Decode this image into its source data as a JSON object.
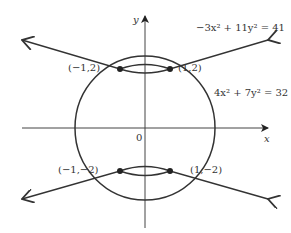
{
  "diagram": {
    "type": "conic-intersection",
    "axes": {
      "x_label": "x",
      "y_label": "y",
      "origin_label": "0"
    },
    "curves": [
      {
        "name": "hyperbola",
        "equation": "−3x² + 11y² = 41"
      },
      {
        "name": "ellipse",
        "equation": "4x² + 7y² = 32"
      }
    ],
    "points": [
      {
        "label": "(−1,2)"
      },
      {
        "label": "(1,2)"
      },
      {
        "label": "(−1,−2)"
      },
      {
        "label": "(1,−2)"
      }
    ]
  }
}
